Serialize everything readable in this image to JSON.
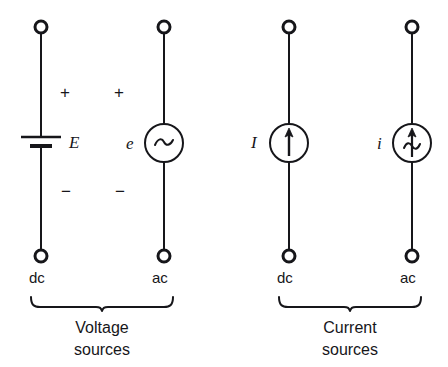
{
  "figure": {
    "background_color": "#ffffff",
    "ink_color": "#16161a"
  },
  "sources": [
    {
      "id": "dc-voltage",
      "symbol": "battery",
      "label": "E",
      "label_side": "right",
      "plus_sign": "+",
      "minus_sign": "−",
      "type_label": "dc",
      "group": "voltage"
    },
    {
      "id": "ac-voltage",
      "symbol": "circle-tilde",
      "label": "e",
      "label_side": "left",
      "glyph": "~",
      "plus_sign": "+",
      "minus_sign": "−",
      "type_label": "ac",
      "group": "voltage"
    },
    {
      "id": "dc-current",
      "symbol": "circle-arrow",
      "label": "I",
      "label_side": "left",
      "glyph": "↑",
      "plus_sign": "",
      "minus_sign": "",
      "type_label": "dc",
      "group": "current"
    },
    {
      "id": "ac-current",
      "symbol": "circle-arrow-tilde",
      "label": "i",
      "label_side": "left",
      "glyph": "↑~",
      "plus_sign": "",
      "minus_sign": "",
      "type_label": "ac",
      "group": "current"
    }
  ],
  "groups": [
    {
      "id": "voltage-sources",
      "caption_line1": "Voltage",
      "caption_line2": "sources",
      "brace": "under-brace"
    },
    {
      "id": "current-sources",
      "caption_line1": "Current",
      "caption_line2": "sources",
      "brace": "under-brace"
    }
  ]
}
